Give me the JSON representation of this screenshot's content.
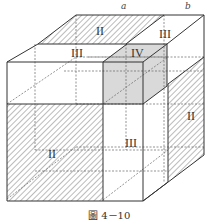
{
  "figure": {
    "caption": "圖 4－10",
    "dimension_labels": {
      "a": "a",
      "b": "b"
    },
    "regions": {
      "top_back_left": "II",
      "top_back_right": "III",
      "top_mid": "III",
      "cube_top": "IV",
      "front_lower_left": "II",
      "front_lower_right": "III",
      "right_side": "II"
    },
    "colors": {
      "edge": "#333333",
      "hatch": "#555555",
      "shaded": "#d9d9d9",
      "background": "#ffffff"
    }
  }
}
